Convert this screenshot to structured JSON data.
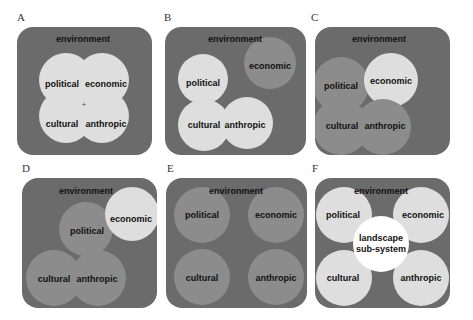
{
  "figure": {
    "panels": [
      {
        "id": "A",
        "environment": "environment",
        "center_mark": "+",
        "circles": {
          "political": "political",
          "economic": "economic",
          "cultural": "cultural",
          "anthropic": "anthropic"
        }
      },
      {
        "id": "B",
        "environment": "environment",
        "circles": {
          "political": "political",
          "economic": "economic",
          "cultural": "cultural",
          "anthropic": "anthropic"
        }
      },
      {
        "id": "C",
        "environment": "environment",
        "circles": {
          "political": "political",
          "economic": "economic",
          "cultural": "cultural",
          "anthropic": "anthropic"
        }
      },
      {
        "id": "D",
        "environment": "environment",
        "circles": {
          "political": "political",
          "economic": "economic",
          "cultural": "cultural",
          "anthropic": "anthropic"
        }
      },
      {
        "id": "E",
        "environment": "environment",
        "circles": {
          "political": "political",
          "economic": "economic",
          "cultural": "cultural",
          "anthropic": "anthropic"
        }
      },
      {
        "id": "F",
        "environment": "environment",
        "center": "landscape sub-system",
        "center_line1": "landscape",
        "center_line2": "sub-system",
        "circles": {
          "political": "political",
          "economic": "economic",
          "cultural": "cultural",
          "anthropic": "anthropic"
        }
      }
    ],
    "colors": {
      "panel_background": "#6b6b6b",
      "light_circle": "#dedede",
      "mid_circle": "#8c8c8c",
      "center_circle": "#ffffff"
    }
  }
}
